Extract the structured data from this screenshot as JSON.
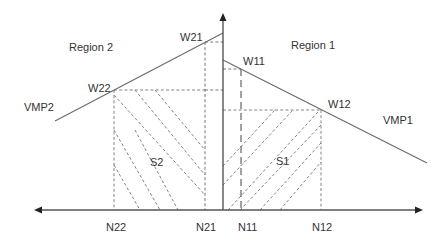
{
  "diagram": {
    "regions": {
      "left": "Region 2",
      "right": "Region 1"
    },
    "curves": {
      "left": "VMP2",
      "right": "VMP1"
    },
    "points": {
      "w21": "W21",
      "w22": "W22",
      "w11": "W11",
      "w12": "W12"
    },
    "axis_ticks": {
      "n22": "N22",
      "n21": "N21",
      "n11": "N11",
      "n12": "N12"
    },
    "areas": {
      "left": "S2",
      "right": "S1"
    },
    "colors": {
      "line": "#6a6a6a",
      "axis": "#555555",
      "text": "#333333",
      "background": "#ffffff"
    }
  }
}
